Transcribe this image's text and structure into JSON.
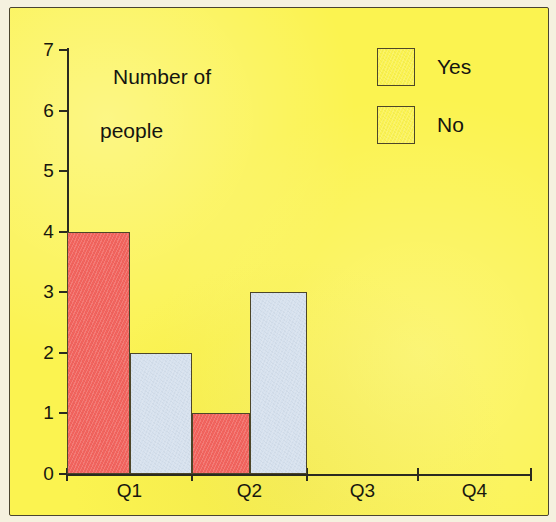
{
  "chart_data": {
    "type": "bar",
    "title": "",
    "xlabel": "",
    "ylabel": "Number of people",
    "ylabel_line1": "Number of",
    "ylabel_line2": "people",
    "categories": [
      "Q1",
      "Q2",
      "Q3",
      "Q4"
    ],
    "yticks": [
      0,
      1,
      2,
      3,
      4,
      5,
      6,
      7
    ],
    "ylim": [
      0,
      7
    ],
    "grid": false,
    "legend_position": "top-right",
    "series": [
      {
        "name": "No",
        "color": "#f2645e",
        "values": [
          4,
          1,
          0,
          0
        ]
      },
      {
        "name": "Yes",
        "color": "#d6e1ee",
        "values": [
          2,
          3,
          0,
          0
        ]
      }
    ],
    "legend": [
      {
        "label": "Yes",
        "color": "#d6e1ee"
      },
      {
        "label": "No",
        "color": "#f2645e"
      }
    ],
    "background_color": "#fbf350",
    "axis_color": "#2a2a20"
  }
}
